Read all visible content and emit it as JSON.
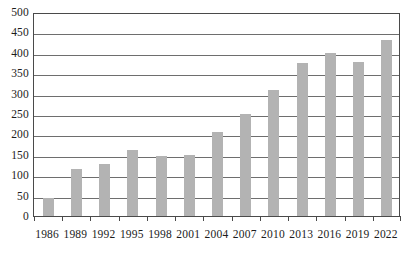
{
  "chart_data": {
    "type": "bar",
    "title": "",
    "xlabel": "",
    "ylabel": "",
    "categories": [
      "1986",
      "1989",
      "1992",
      "1995",
      "1998",
      "2001",
      "2004",
      "2007",
      "2010",
      "2013",
      "2016",
      "2019",
      "2022"
    ],
    "values": [
      45,
      115,
      127,
      162,
      147,
      150,
      205,
      250,
      310,
      375,
      400,
      378,
      432
    ],
    "ylim": [
      0,
      500
    ],
    "ytick_labels": [
      "500",
      "450",
      "400",
      "350",
      "300",
      "250",
      "200",
      "150",
      "100",
      "50",
      "0"
    ],
    "ytick_values": [
      500,
      450,
      400,
      350,
      300,
      250,
      200,
      150,
      100,
      50,
      0
    ],
    "ytick_step": 50,
    "grid": true,
    "legend": false,
    "legend_position": "none",
    "bar_color": "#b3b3b3",
    "axis_color": "#4a4a4a",
    "gridline_color": "#6e6e6e",
    "text_color": "#1c1c1c"
  }
}
